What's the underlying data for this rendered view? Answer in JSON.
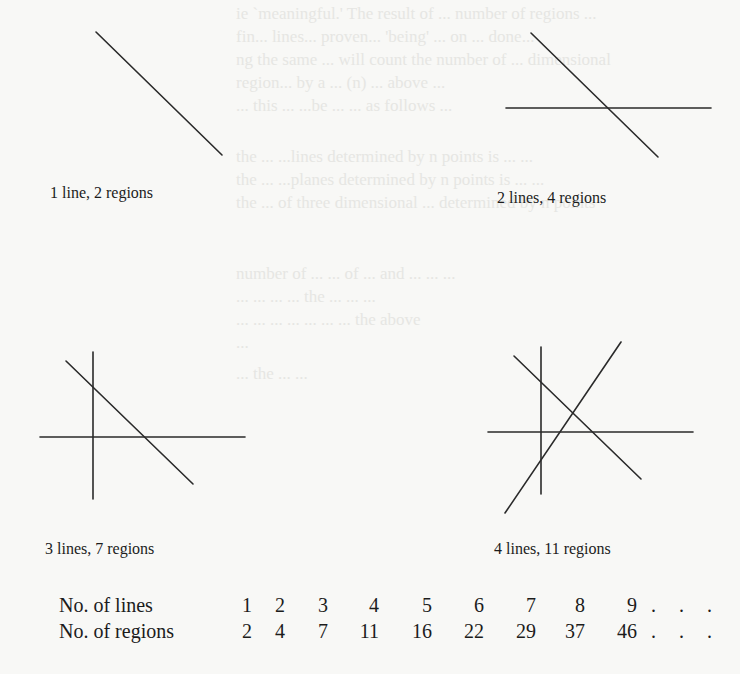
{
  "bleed_text": {
    "top": [
      "ie `meaningful.' The result of ... number of regions ...",
      "fin... lines... proven... 'being' ... on ... done...",
      "ng the same ... will count the number of ... dimensional",
      "region... by a ... (n) ... above ...",
      "... this ... ...be ... ... as follows ..."
    ],
    "middle": [
      "the ... ...lines determined by n points is ... ...",
      "the ... ...planes determined by n points is ... ...",
      "the ... of three dimensional ... determined by n points",
      "",
      "number of ... ... of ... and ... ... ...",
      "... ... ... ... the ... ... ...",
      "... ... ... ... ... ... ... the above",
      "...",
      "... the ... ..."
    ]
  },
  "figures": [
    {
      "caption": "1 line, 2 regions",
      "lines": 1,
      "regions": 2,
      "segments": [
        [
          96,
          32,
          222,
          155
        ]
      ]
    },
    {
      "caption": "2 lines, 4 regions",
      "lines": 2,
      "regions": 4,
      "segments": [
        [
          531,
          33,
          658,
          157
        ],
        [
          506,
          108,
          711,
          108
        ]
      ]
    },
    {
      "caption": "3 lines, 7 regions",
      "lines": 3,
      "regions": 7,
      "segments": [
        [
          93,
          352,
          93,
          499
        ],
        [
          40,
          437,
          245,
          437
        ],
        [
          66,
          361,
          193,
          484
        ]
      ]
    },
    {
      "caption": "4 lines, 11 regions",
      "lines": 4,
      "regions": 11,
      "segments": [
        [
          541,
          347,
          541,
          494
        ],
        [
          488,
          432,
          693,
          432
        ],
        [
          514,
          356,
          641,
          479
        ],
        [
          505,
          513,
          621,
          342
        ]
      ]
    }
  ],
  "table": {
    "row_labels": [
      "No. of lines",
      "No. of regions"
    ],
    "lines": [
      "1",
      "2",
      "3",
      "4",
      "5",
      "6",
      "7",
      "8",
      "9"
    ],
    "regions": [
      "2",
      "4",
      "7",
      "11",
      "16",
      "22",
      "29",
      "37",
      "46"
    ],
    "continuation": ". . ."
  },
  "chart_data": {
    "type": "table",
    "title": "",
    "columns": [
      "No. of lines",
      "No. of regions"
    ],
    "x": [
      1,
      2,
      3,
      4,
      5,
      6,
      7,
      8,
      9
    ],
    "series": [
      {
        "name": "No. of regions",
        "values": [
          2,
          4,
          7,
          11,
          16,
          22,
          29,
          37,
          46
        ]
      }
    ]
  }
}
